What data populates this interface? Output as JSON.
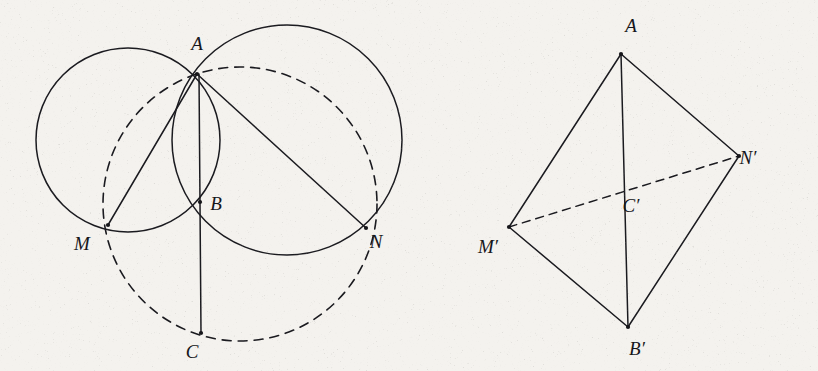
{
  "figure": {
    "caption": "",
    "background_color": "#f4f2ee",
    "ink_color": "#1a1a1f",
    "panels": [
      {
        "id": "left-panel",
        "name": "two-intersecting-circles-with-circumcircle",
        "labels": [
          {
            "id": "A",
            "text": "A",
            "x": 197,
            "y": 50,
            "point_x": 197,
            "point_y": 74
          },
          {
            "id": "B",
            "text": "B",
            "x": 216,
            "y": 210,
            "point_x": 200,
            "point_y": 202
          },
          {
            "id": "C",
            "text": "C",
            "x": 192,
            "y": 358,
            "point_x": 201,
            "point_y": 333
          },
          {
            "id": "M",
            "text": "M",
            "x": 82,
            "y": 250,
            "point_x": 108,
            "point_y": 225
          },
          {
            "id": "N",
            "text": "N",
            "x": 376,
            "y": 248,
            "point_x": 366,
            "point_y": 228
          }
        ],
        "circles": [
          {
            "id": "circle-left",
            "cx": 128,
            "cy": 140,
            "r": 92,
            "style": "solid"
          },
          {
            "id": "circle-right",
            "cx": 287,
            "cy": 140,
            "r": 115,
            "style": "solid"
          },
          {
            "id": "circle-dashed",
            "cx": 240,
            "cy": 204,
            "r": 137,
            "style": "dashed"
          }
        ],
        "segments": [
          {
            "id": "seg-AM",
            "x1": 197,
            "y1": 74,
            "x2": 108,
            "y2": 225,
            "style": "solid"
          },
          {
            "id": "seg-AN",
            "x1": 197,
            "y1": 74,
            "x2": 366,
            "y2": 228,
            "style": "solid"
          },
          {
            "id": "seg-AC",
            "x1": 199,
            "y1": 74,
            "x2": 201,
            "y2": 333,
            "style": "solid"
          }
        ]
      },
      {
        "id": "right-panel",
        "name": "tetrahedron-quadrilateral",
        "labels": [
          {
            "id": "A-prime",
            "text": "A",
            "x": 631,
            "y": 32,
            "point_x": 621,
            "point_y": 54
          },
          {
            "id": "B-prime",
            "text": "B′",
            "x": 637,
            "y": 355,
            "point_x": 628,
            "point_y": 327
          },
          {
            "id": "C-prime",
            "text": "C′",
            "x": 631,
            "y": 212,
            "point_x": 622,
            "point_y": 190
          },
          {
            "id": "M-prime",
            "text": "M′",
            "x": 488,
            "y": 253,
            "point_x": 509,
            "point_y": 227
          },
          {
            "id": "N-prime",
            "text": "N′",
            "x": 748,
            "y": 164,
            "point_x": 739,
            "point_y": 156
          }
        ],
        "segments": [
          {
            "id": "seg-A-M-prime",
            "x1": 621,
            "y1": 54,
            "x2": 509,
            "y2": 227,
            "style": "solid"
          },
          {
            "id": "seg-A-N-prime",
            "x1": 621,
            "y1": 54,
            "x2": 739,
            "y2": 156,
            "style": "solid"
          },
          {
            "id": "seg-A-B-prime",
            "x1": 621,
            "y1": 54,
            "x2": 628,
            "y2": 327,
            "style": "solid"
          },
          {
            "id": "seg-M-B-prime",
            "x1": 509,
            "y1": 227,
            "x2": 628,
            "y2": 327,
            "style": "solid"
          },
          {
            "id": "seg-N-B-prime",
            "x1": 739,
            "y1": 156,
            "x2": 628,
            "y2": 327,
            "style": "solid"
          },
          {
            "id": "seg-M-N-prime",
            "x1": 509,
            "y1": 227,
            "x2": 739,
            "y2": 156,
            "style": "dashed"
          }
        ]
      }
    ]
  }
}
